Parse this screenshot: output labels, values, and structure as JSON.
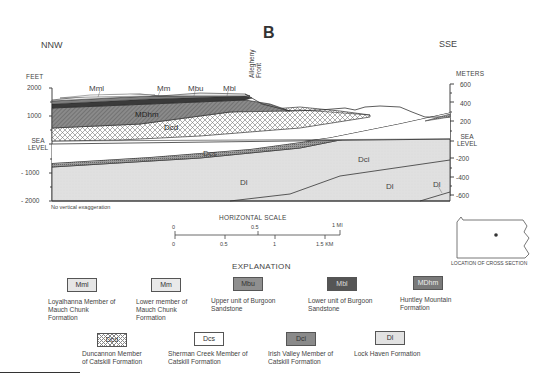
{
  "figure": {
    "panel_letter": "B",
    "left_direction": "NNW",
    "right_direction": "SSE",
    "left_axis_title": "FEET",
    "right_axis_title": "METERS",
    "left_ticks": [
      "2000",
      "1000",
      "SEA LEVEL",
      "- 1000",
      "- 2000"
    ],
    "right_ticks": [
      "600",
      "400",
      "200",
      "SEA LEVEL",
      "-200",
      "-400",
      "-600"
    ],
    "note": "No vertical exaggeration",
    "feature_label": "Allegheny Front",
    "unit_labels": {
      "mml": "Mml",
      "mm": "Mm",
      "mbu": "Mbu",
      "mbl": "Mbl",
      "mdhm": "MDhm",
      "dcd": "Dcd",
      "dcs": "Dcs",
      "dci": "Dci",
      "dl1": "Dl",
      "dl2": "Dl",
      "dl3": "Dl"
    }
  },
  "scale": {
    "title": "HORIZONTAL SCALE",
    "mi_ticks": [
      "0",
      "0.5",
      "1 MI"
    ],
    "km_ticks": [
      "0",
      "0.5",
      "1",
      "1.5 KM"
    ]
  },
  "location_map": {
    "label": "LOCATION OF CROSS SECTION"
  },
  "explanation": {
    "title": "EXPLANATION",
    "items": [
      {
        "symbol": "Mml",
        "description": "Loyalhanna Member of Mauch Chunk Formation",
        "fill": "#e6e6e6"
      },
      {
        "symbol": "Mm",
        "description": "Lower member of Mauch Chunk Formation",
        "fill": "#e9e9e9"
      },
      {
        "symbol": "Mbu",
        "description": "Upper unit of Burgoon Sandstone",
        "fill": "#8f8f8f"
      },
      {
        "symbol": "Mbl",
        "description": "Lower unit of Burgoon Sandstone",
        "fill": "#555555"
      },
      {
        "symbol": "MDhm",
        "description": "Huntley Mountain Formation",
        "fill": "#7a7a7a"
      },
      {
        "symbol": "Dcd",
        "description": "Duncannon Member of Catskill Formation",
        "fill": "crosshatch"
      },
      {
        "symbol": "Dcs",
        "description": "Sherman Creek Member of Catskill Formation",
        "fill": "#ffffff"
      },
      {
        "symbol": "Dci",
        "description": "Irish Valley Member of Catskill Formation",
        "fill": "#8a8a8a"
      },
      {
        "symbol": "Dl",
        "description": "Lock Haven Formation",
        "fill": "#e2e2e2"
      }
    ]
  }
}
